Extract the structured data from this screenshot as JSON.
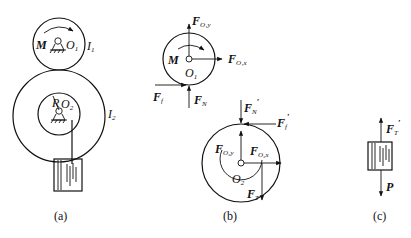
{
  "panels": {
    "a": {
      "caption": "(a)",
      "labels": {
        "moment": "M",
        "pivot1": "O",
        "pivot1_sub": "1",
        "inertia1": "I",
        "inertia1_sub": "1",
        "radius": "R",
        "pivot2": "O",
        "pivot2_sub": "2",
        "inertia2": "I",
        "inertia2_sub": "2"
      }
    },
    "b": {
      "caption": "(b)",
      "labels": {
        "moment": "M",
        "pivot1": "O",
        "pivot1_sub": "1",
        "F": "F",
        "FO1y_sub": "O₁y",
        "FO1x_sub": "O₁x",
        "Ff_sub": "f",
        "FN_sub": "N",
        "FN_prime_sub": "N",
        "Ff_prime_sub": "f",
        "prime": "′",
        "FO2y_sub": "O₂y",
        "FO2x_sub": "O₂x",
        "pivot2": "O",
        "pivot2_sub": "2",
        "FT_sub": "T"
      }
    },
    "c": {
      "caption": "(c)",
      "labels": {
        "F": "F",
        "FT_prime_sub": "T",
        "prime": "′",
        "weight": "P"
      }
    }
  }
}
